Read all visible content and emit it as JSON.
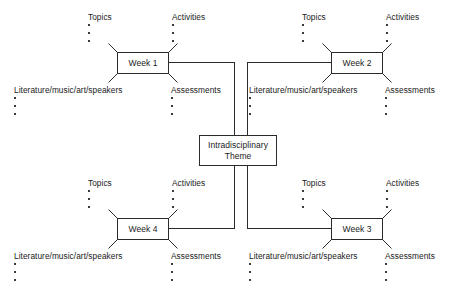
{
  "diagram": {
    "center": {
      "label": "Intradisciplinary\nTheme",
      "line1": "Intradisciplinary",
      "line2": "Theme"
    },
    "bullet_count": 3,
    "colors": {
      "stroke": "#2b2b2b",
      "text": "#1a1a1a",
      "background": "#ffffff",
      "bullet": "#3a3a3a"
    },
    "branch_labels": {
      "topics": "Topics",
      "activities": "Activities",
      "literature": "Literature/music/art/speakers",
      "assessments": "Assessments"
    },
    "weeks": [
      {
        "id": "week-1",
        "label": "Week 1",
        "quadrant": "top-left",
        "branches": [
          "Topics",
          "Activities",
          "Literature/music/art/speakers",
          "Assessments"
        ]
      },
      {
        "id": "week-2",
        "label": "Week 2",
        "quadrant": "top-right",
        "branches": [
          "Topics",
          "Activities",
          "Literature/music/art/speakers",
          "Assessments"
        ]
      },
      {
        "id": "week-3",
        "label": "Week 3",
        "quadrant": "bottom-right",
        "branches": [
          "Topics",
          "Activities",
          "Literature/music/art/speakers",
          "Assessments"
        ]
      },
      {
        "id": "week-4",
        "label": "Week 4",
        "quadrant": "bottom-left",
        "branches": [
          "Topics",
          "Activities",
          "Literature/music/art/speakers",
          "Assessments"
        ]
      }
    ]
  }
}
